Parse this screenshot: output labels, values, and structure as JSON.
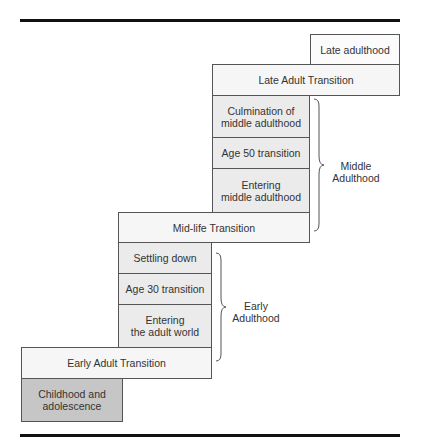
{
  "diagram": {
    "stages": {
      "late_adulthood": "Late adulthood",
      "late_adult_transition": "Late Adult Transition",
      "culmination_middle": "Culmination of\nmiddle adulthood",
      "age50": "Age 50 transition",
      "entering_middle": "Entering\nmiddle adulthood",
      "midlife_transition": "Mid-life Transition",
      "settling_down": "Settling down",
      "age30": "Age 30 transition",
      "entering_adult": "Entering\nthe adult world",
      "early_adult_transition": "Early Adult Transition",
      "childhood": "Childhood and\nadolescence"
    },
    "eras": {
      "middle": "Middle\nAdulthood",
      "early": "Early\nAdulthood"
    }
  }
}
